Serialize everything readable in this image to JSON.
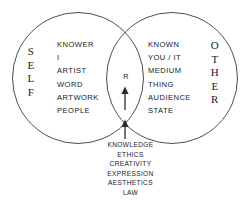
{
  "diagram": {
    "type": "venn-two-set",
    "title": "",
    "left_set": {
      "name": "SELF",
      "label_letters": [
        "S",
        "E",
        "L",
        "F"
      ],
      "terms": [
        "KNOWER",
        "I",
        "ARTIST",
        "WORD",
        "ARTWORK",
        "PEOPLE"
      ]
    },
    "right_set": {
      "name": "OTHER",
      "label_letters": [
        "O",
        "T",
        "H",
        "E",
        "R"
      ],
      "terms": [
        "KNOWN",
        "YOU / IT",
        "MEDIUM",
        "THING",
        "AUDIENCE",
        "STATE"
      ]
    },
    "intersection": {
      "label": "R",
      "terms": [
        "KNOWLEDGE",
        "ETHICS",
        "CREATIVITY",
        "EXPRESSION",
        "AESTHETICS",
        "LAW"
      ]
    },
    "arrows": [
      {
        "name": "inner-arrow",
        "direction": "up"
      },
      {
        "name": "outer-arrow",
        "direction": "up"
      }
    ],
    "colors": {
      "stroke": "#3a3a3a",
      "text": "#1a1a1a",
      "background": "#ffffff"
    }
  }
}
